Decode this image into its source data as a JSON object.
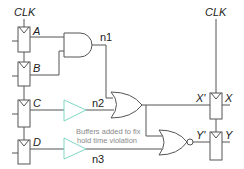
{
  "diagram": {
    "clock_labels": {
      "left": "CLK",
      "right": "CLK"
    },
    "input_flops": [
      "A",
      "B",
      "C",
      "D"
    ],
    "output_flops": [
      {
        "in": "X'",
        "out": "X"
      },
      {
        "in": "Y'",
        "out": "Y"
      }
    ],
    "nets": {
      "n1": "n1",
      "n2": "n2",
      "n3": "n3"
    },
    "gates": [
      "AND",
      "OR",
      "NOR"
    ],
    "buffers": [
      "buffer-C",
      "buffer-D"
    ],
    "annotation": {
      "line1": "Buffers added to fix",
      "line2": "hold time violation"
    },
    "colors": {
      "wire": "#555555",
      "buffer": "#7fd6c6",
      "annotation": "#8a8a8a"
    }
  }
}
